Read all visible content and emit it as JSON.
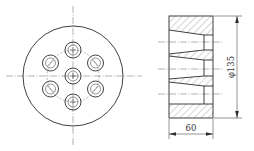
{
  "figure": {
    "type": "engineering-drawing",
    "views": [
      "front-view",
      "section-view"
    ]
  },
  "front_view": {
    "outer_circle": {
      "cx": 73,
      "cy": 76,
      "r": 50
    },
    "bolt_circle_r": 26,
    "hole_count": 7,
    "holes": [
      {
        "cx": 73,
        "cy": 76
      },
      {
        "cx": 73,
        "cy": 50
      },
      {
        "cx": 73,
        "cy": 102
      },
      {
        "cx": 50.5,
        "cy": 63
      },
      {
        "cx": 95.5,
        "cy": 63
      },
      {
        "cx": 50.5,
        "cy": 89
      },
      {
        "cx": 95.5,
        "cy": 89
      }
    ],
    "hole_outer_r": 8,
    "hole_inner_r": 5
  },
  "section_view": {
    "body": {
      "x": 169,
      "y": 16,
      "w": 44,
      "h": 102
    }
  },
  "dimensions": {
    "diameter_label": "φ135",
    "width_label": "60"
  },
  "colors": {
    "line": "#2b2b2b",
    "background": "#ffffff"
  }
}
